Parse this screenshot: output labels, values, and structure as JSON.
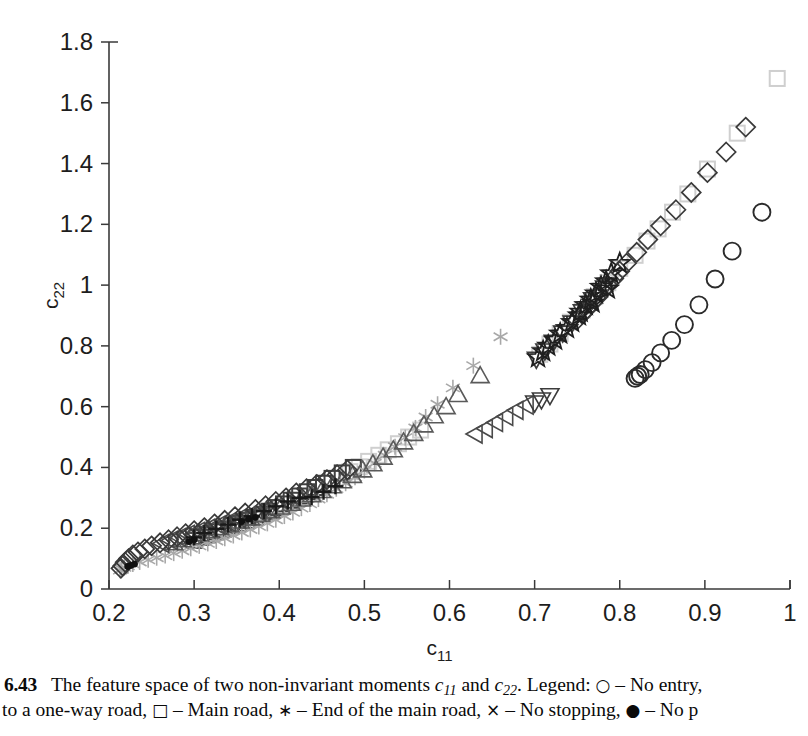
{
  "figure": {
    "number": "6.43",
    "caption_line1_parts": {
      "a": "The feature space of two non-invariant moments ",
      "c11": "c",
      "c11sub": "11",
      "b": " and ",
      "c22": "c",
      "c22sub": "22",
      "c": ". Legend: ",
      "sym1": "○",
      "d": " – No entry,"
    },
    "caption_line2_parts": {
      "a": "to a one-way road, ",
      "sym1": "□",
      "b": " – Main road, ",
      "sym2": "∗",
      "c": " – End of the main road, ",
      "sym3": "×",
      "d": " – No stopping, ",
      "sym4": "●",
      "e": " – No p"
    }
  },
  "axes": {
    "x_label": "c",
    "x_label_sub": "11",
    "y_label": "c",
    "y_label_sub": "22",
    "x_ticks": [
      "0.2",
      "0.3",
      "0.4",
      "0.5",
      "0.6",
      "0.7",
      "0.8",
      "0.9",
      "1"
    ],
    "y_ticks": [
      "0",
      "0.2",
      "0.4",
      "0.6",
      "0.8",
      "1",
      "1.2",
      "1.4",
      "1.6",
      "1.8"
    ],
    "x_min": 0.2,
    "x_max": 1.0,
    "y_min": 0,
    "y_max": 1.8,
    "axis_color": "#3a3a3a",
    "grid": false
  },
  "chart_data": {
    "type": "scatter",
    "title": "",
    "xlabel": "c11",
    "ylabel": "c22",
    "xlim": [
      0.2,
      1.0
    ],
    "ylim": [
      0,
      1.8
    ],
    "grid": false,
    "legend_position": "caption",
    "series": [
      {
        "name": "No entry to a one-way road",
        "marker": "circle",
        "color": "#2b2b2b",
        "points": [
          [
            0.818,
            0.693
          ],
          [
            0.821,
            0.7
          ],
          [
            0.824,
            0.706
          ],
          [
            0.83,
            0.722
          ],
          [
            0.838,
            0.745
          ],
          [
            0.848,
            0.777
          ],
          [
            0.861,
            0.818
          ],
          [
            0.876,
            0.87
          ],
          [
            0.893,
            0.935
          ],
          [
            0.912,
            1.02
          ],
          [
            0.932,
            1.112
          ],
          [
            0.967,
            1.24
          ]
        ]
      },
      {
        "name": "Main road",
        "marker": "square",
        "color": "#cfcfcf",
        "points": [
          [
            0.985,
            1.68
          ],
          [
            0.938,
            1.5
          ],
          [
            0.903,
            1.382
          ],
          [
            0.88,
            1.3
          ],
          [
            0.862,
            1.24
          ],
          [
            0.845,
            1.185
          ],
          [
            0.832,
            1.145
          ],
          [
            0.818,
            1.098
          ],
          [
            0.8,
            1.055
          ],
          [
            0.786,
            1.008
          ],
          [
            0.77,
            0.962
          ],
          [
            0.756,
            0.918
          ],
          [
            0.742,
            0.878
          ],
          [
            0.73,
            0.84
          ],
          [
            0.718,
            0.806
          ],
          [
            0.706,
            0.772
          ],
          [
            0.566,
            0.523
          ],
          [
            0.552,
            0.5
          ],
          [
            0.54,
            0.478
          ],
          [
            0.528,
            0.458
          ],
          [
            0.517,
            0.44
          ],
          [
            0.505,
            0.42
          ],
          [
            0.494,
            0.402
          ],
          [
            0.483,
            0.386
          ]
        ]
      },
      {
        "name": "Main road (dark squares)",
        "marker": "square",
        "color": "#404040",
        "points": [
          [
            0.487,
            0.4
          ],
          [
            0.474,
            0.382
          ],
          [
            0.462,
            0.364
          ],
          [
            0.452,
            0.348
          ],
          [
            0.442,
            0.334
          ],
          [
            0.433,
            0.32
          ],
          [
            0.424,
            0.306
          ],
          [
            0.414,
            0.292
          ],
          [
            0.405,
            0.28
          ],
          [
            0.396,
            0.268
          ],
          [
            0.388,
            0.256
          ],
          [
            0.38,
            0.246
          ],
          [
            0.372,
            0.236
          ],
          [
            0.362,
            0.226
          ],
          [
            0.352,
            0.216
          ],
          [
            0.344,
            0.208
          ],
          [
            0.334,
            0.196
          ],
          [
            0.326,
            0.188
          ],
          [
            0.316,
            0.178
          ],
          [
            0.308,
            0.17
          ],
          [
            0.3,
            0.16
          ]
        ]
      },
      {
        "name": "End of the main road",
        "marker": "asterisk",
        "color": "#a8a8a8",
        "points": [
          [
            0.66,
            0.83
          ],
          [
            0.628,
            0.735
          ],
          [
            0.604,
            0.662
          ],
          [
            0.586,
            0.608
          ],
          [
            0.572,
            0.566
          ],
          [
            0.56,
            0.53
          ],
          [
            0.548,
            0.498
          ],
          [
            0.536,
            0.468
          ],
          [
            0.524,
            0.44
          ],
          [
            0.512,
            0.414
          ],
          [
            0.5,
            0.39
          ],
          [
            0.489,
            0.368
          ],
          [
            0.478,
            0.348
          ],
          [
            0.467,
            0.33
          ],
          [
            0.456,
            0.312
          ],
          [
            0.446,
            0.296
          ],
          [
            0.436,
            0.28
          ],
          [
            0.426,
            0.266
          ],
          [
            0.416,
            0.252
          ],
          [
            0.406,
            0.24
          ],
          [
            0.396,
            0.228
          ],
          [
            0.386,
            0.216
          ],
          [
            0.376,
            0.206
          ],
          [
            0.366,
            0.196
          ],
          [
            0.356,
            0.186
          ],
          [
            0.346,
            0.176
          ],
          [
            0.336,
            0.167
          ],
          [
            0.326,
            0.158
          ],
          [
            0.316,
            0.15
          ],
          [
            0.306,
            0.142
          ],
          [
            0.296,
            0.134
          ],
          [
            0.286,
            0.126
          ],
          [
            0.276,
            0.118
          ],
          [
            0.266,
            0.11
          ],
          [
            0.256,
            0.103
          ],
          [
            0.246,
            0.096
          ],
          [
            0.236,
            0.089
          ],
          [
            0.228,
            0.082
          ],
          [
            0.222,
            0.076
          ],
          [
            0.218,
            0.071
          ],
          [
            0.215,
            0.066
          ],
          [
            0.213,
            0.062
          ]
        ]
      },
      {
        "name": "No stopping",
        "marker": "plus",
        "color": "#1a1a1a",
        "points": [
          [
            0.466,
            0.338
          ],
          [
            0.452,
            0.32
          ],
          [
            0.438,
            0.302
          ],
          [
            0.424,
            0.3
          ],
          [
            0.41,
            0.288
          ],
          [
            0.396,
            0.272
          ],
          [
            0.382,
            0.256
          ],
          [
            0.368,
            0.24
          ],
          [
            0.354,
            0.228
          ],
          [
            0.34,
            0.212
          ],
          [
            0.326,
            0.198
          ],
          [
            0.312,
            0.184
          ],
          [
            0.3,
            0.17
          ]
        ]
      },
      {
        "name": "No parking",
        "marker": "dot",
        "color": "#111111",
        "points": [
          [
            0.372,
            0.236
          ],
          [
            0.364,
            0.23
          ],
          [
            0.356,
            0.222
          ],
          [
            0.3,
            0.162
          ],
          [
            0.294,
            0.156
          ],
          [
            0.23,
            0.082
          ],
          [
            0.226,
            0.078
          ],
          [
            0.222,
            0.074
          ]
        ]
      },
      {
        "name": "Series diamond (light)",
        "marker": "diamond",
        "color": "#3a3a3a",
        "points": [
          [
            0.948,
            1.52
          ],
          [
            0.925,
            1.438
          ],
          [
            0.903,
            1.37
          ],
          [
            0.884,
            1.305
          ],
          [
            0.866,
            1.248
          ],
          [
            0.848,
            1.195
          ],
          [
            0.833,
            1.15
          ],
          [
            0.82,
            1.108
          ],
          [
            0.808,
            1.072
          ],
          [
            0.8,
            1.046
          ],
          [
            0.793,
            1.022
          ],
          [
            0.786,
            1.0
          ],
          [
            0.78,
            0.98
          ],
          [
            0.774,
            0.96
          ],
          [
            0.768,
            0.942
          ],
          [
            0.762,
            0.922
          ],
          [
            0.756,
            0.904
          ],
          [
            0.75,
            0.886
          ],
          [
            0.48,
            0.392
          ],
          [
            0.468,
            0.376
          ],
          [
            0.456,
            0.36
          ],
          [
            0.444,
            0.344
          ],
          [
            0.432,
            0.33
          ],
          [
            0.42,
            0.316
          ],
          [
            0.408,
            0.3
          ],
          [
            0.396,
            0.288
          ],
          [
            0.384,
            0.274
          ],
          [
            0.372,
            0.262
          ],
          [
            0.36,
            0.25
          ],
          [
            0.348,
            0.238
          ],
          [
            0.336,
            0.226
          ],
          [
            0.324,
            0.214
          ],
          [
            0.312,
            0.202
          ],
          [
            0.3,
            0.192
          ],
          [
            0.29,
            0.182
          ],
          [
            0.28,
            0.172
          ],
          [
            0.27,
            0.162
          ],
          [
            0.26,
            0.152
          ],
          [
            0.25,
            0.142
          ],
          [
            0.242,
            0.132
          ],
          [
            0.234,
            0.122
          ],
          [
            0.228,
            0.112
          ],
          [
            0.223,
            0.1
          ],
          [
            0.219,
            0.088
          ],
          [
            0.216,
            0.076
          ],
          [
            0.214,
            0.068
          ]
        ]
      },
      {
        "name": "Series star",
        "marker": "star",
        "color": "#1f1f1f",
        "points": [
          [
            0.8,
            1.072
          ],
          [
            0.79,
            1.038
          ],
          [
            0.784,
            1.012
          ],
          [
            0.778,
            0.994
          ],
          [
            0.772,
            0.972
          ],
          [
            0.766,
            0.952
          ],
          [
            0.76,
            0.934
          ],
          [
            0.754,
            0.912
          ],
          [
            0.786,
            0.988
          ],
          [
            0.768,
            0.942
          ],
          [
            0.744,
            0.878
          ],
          [
            0.73,
            0.84
          ],
          [
            0.716,
            0.8
          ],
          [
            0.752,
            0.9
          ],
          [
            0.738,
            0.858
          ],
          [
            0.724,
            0.82
          ],
          [
            0.71,
            0.782
          ],
          [
            0.704,
            0.762
          ]
        ]
      },
      {
        "name": "Series triangle-down",
        "marker": "triangle-down",
        "color": "#3c3c3c",
        "points": [
          [
            0.782,
            0.99
          ],
          [
            0.768,
            0.952
          ],
          [
            0.756,
            0.912
          ],
          [
            0.744,
            0.875
          ],
          [
            0.733,
            0.842
          ],
          [
            0.722,
            0.812
          ],
          [
            0.712,
            0.783
          ],
          [
            0.702,
            0.756
          ],
          [
            0.718,
            0.636
          ],
          [
            0.708,
            0.622
          ],
          [
            0.7,
            0.612
          ]
        ]
      },
      {
        "name": "Series triangle-up",
        "marker": "triangle-up",
        "color": "#5a5a5a",
        "points": [
          [
            0.636,
            0.702
          ],
          [
            0.61,
            0.64
          ],
          [
            0.596,
            0.6
          ],
          [
            0.582,
            0.57
          ],
          [
            0.57,
            0.54
          ],
          [
            0.558,
            0.512
          ],
          [
            0.546,
            0.484
          ],
          [
            0.534,
            0.458
          ],
          [
            0.522,
            0.434
          ],
          [
            0.51,
            0.412
          ],
          [
            0.498,
            0.392
          ],
          [
            0.486,
            0.374
          ],
          [
            0.474,
            0.356
          ],
          [
            0.462,
            0.34
          ],
          [
            0.45,
            0.324
          ],
          [
            0.438,
            0.31
          ],
          [
            0.426,
            0.296
          ],
          [
            0.414,
            0.282
          ],
          [
            0.402,
            0.27
          ],
          [
            0.39,
            0.258
          ],
          [
            0.378,
            0.246
          ],
          [
            0.366,
            0.234
          ],
          [
            0.354,
            0.224
          ],
          [
            0.342,
            0.212
          ],
          [
            0.33,
            0.202
          ],
          [
            0.318,
            0.192
          ],
          [
            0.306,
            0.182
          ],
          [
            0.296,
            0.172
          ],
          [
            0.286,
            0.162
          ],
          [
            0.276,
            0.152
          ]
        ]
      },
      {
        "name": "Series triangle-left",
        "marker": "triangle-left",
        "color": "#4a4a4a",
        "points": [
          [
            0.69,
            0.605
          ],
          [
            0.678,
            0.588
          ],
          [
            0.666,
            0.568
          ],
          [
            0.654,
            0.548
          ],
          [
            0.642,
            0.528
          ],
          [
            0.63,
            0.51
          ],
          [
            0.388,
            0.266
          ],
          [
            0.376,
            0.254
          ],
          [
            0.364,
            0.242
          ],
          [
            0.352,
            0.232
          ],
          [
            0.34,
            0.22
          ],
          [
            0.328,
            0.21
          ],
          [
            0.316,
            0.2
          ],
          [
            0.304,
            0.19
          ],
          [
            0.292,
            0.18
          ],
          [
            0.282,
            0.17
          ],
          [
            0.272,
            0.16
          ],
          [
            0.262,
            0.15
          ]
        ]
      }
    ]
  }
}
